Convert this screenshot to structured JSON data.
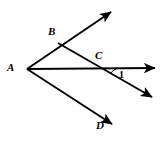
{
  "figure": {
    "type": "geometry-diagram",
    "background_color": "#ffffff",
    "stroke_color": "#000000",
    "labels": {
      "a": "A",
      "b": "B",
      "c": "C",
      "d": "D",
      "angle_one": "1"
    },
    "points": {
      "A": {
        "x": 27,
        "y": 69
      },
      "B": {
        "x": 58,
        "y": 43
      },
      "C": {
        "x": 100,
        "y": 67
      },
      "D": {
        "x": 110,
        "y": 123
      }
    },
    "rays": [
      {
        "name": "ray-AB",
        "from": "A",
        "through": "B",
        "tip_x": 115,
        "tip_y": 8
      },
      {
        "name": "ray-AC",
        "from": "A",
        "through": "C",
        "tip_x": 160,
        "tip_y": 68
      },
      {
        "name": "ray-AD",
        "from": "A",
        "through": "D",
        "tip_x": 117,
        "tip_y": 128
      },
      {
        "name": "ray-BC",
        "from": "B",
        "through": "C",
        "tip_x": 157,
        "tip_y": 101
      }
    ],
    "angle_arc": {
      "name": "angle-1-arc",
      "vertex": "C",
      "radius": 18,
      "label": "1"
    }
  }
}
